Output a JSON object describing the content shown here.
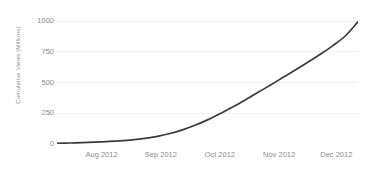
{
  "chart_data": {
    "type": "line",
    "title": "",
    "xlabel": "",
    "ylabel": "Cumulative Views (Millions)",
    "grid": true,
    "legend": false,
    "line_color": "#3a3a3a",
    "grid_color": "#f0f0f0",
    "axis_color": "#b4b4b4",
    "background": "#ffffff",
    "ylim": [
      0,
      1000
    ],
    "yticks": [
      0,
      250,
      500,
      750,
      1000
    ],
    "ytick_labels": [
      "0",
      "250",
      "500",
      "750",
      "1000"
    ],
    "xtick_labels": [
      "Aug 2012",
      "Sep 2012",
      "Oct 2012",
      "Nov 2012",
      "Dec 2012"
    ],
    "xtick_positions": [
      0.148,
      0.345,
      0.541,
      0.738,
      0.928
    ],
    "x": [
      "2012-07-15",
      "2012-07-22",
      "2012-07-29",
      "2012-08-05",
      "2012-08-12",
      "2012-08-19",
      "2012-08-26",
      "2012-09-02",
      "2012-09-09",
      "2012-09-16",
      "2012-09-23",
      "2012-09-30",
      "2012-10-07",
      "2012-10-14",
      "2012-10-21",
      "2012-10-28",
      "2012-11-04",
      "2012-11-11",
      "2012-11-18",
      "2012-11-25",
      "2012-12-02",
      "2012-12-09",
      "2012-12-16",
      "2012-12-23",
      "2012-12-28"
    ],
    "values": [
      5,
      8,
      11,
      15,
      20,
      26,
      34,
      46,
      62,
      85,
      115,
      152,
      196,
      246,
      300,
      358,
      418,
      478,
      540,
      602,
      665,
      730,
      800,
      880,
      995
    ],
    "series": [
      {
        "name": "Cumulative Views",
        "color": "#3a3a3a",
        "values": [
          5,
          8,
          11,
          15,
          20,
          26,
          34,
          46,
          62,
          85,
          115,
          152,
          196,
          246,
          300,
          358,
          418,
          478,
          540,
          602,
          665,
          730,
          800,
          880,
          995
        ]
      }
    ]
  }
}
